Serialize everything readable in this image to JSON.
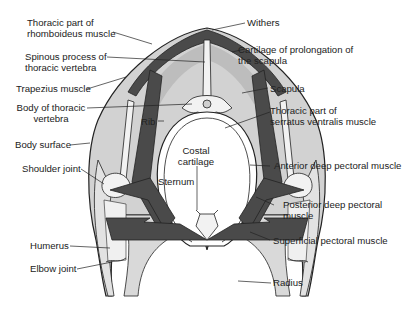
{
  "figure": {
    "type": "anatomical cross-section",
    "colors": {
      "background": "#ffffff",
      "body_fill": "#d2d2d2",
      "muscle_dark": "#4a4a4a",
      "bone_light": "#f2f2f2",
      "outline": "#222222"
    }
  },
  "labels": {
    "left": {
      "rhomboideus_1": "Thoracic part of",
      "rhomboideus_2": "rhomboideus muscle",
      "spinous_1": "Spinous process of",
      "spinous_2": "thoracic vertebra",
      "trapezius": "Trapezius muscle",
      "body_vert_1": "Body of thoracic",
      "body_vert_2": "vertebra",
      "body_surface": "Body surface",
      "shoulder_joint": "Shoulder joint",
      "humerus": "Humerus",
      "elbow_joint": "Elbow joint"
    },
    "right": {
      "withers": "Withers",
      "cartilage_1": "Cartilage of prolongation of",
      "cartilage_2": "the scapula",
      "scapula": "Scapula",
      "serratus_1": "Thoracic part of",
      "serratus_2": "serratus ventralis muscle",
      "anterior_deep": "Anterior deep pectoral muscle",
      "posterior_deep_1": "Posterior deep pectoral",
      "posterior_deep_2": "muscle",
      "superficial": "Superficial pectoral muscle",
      "radius": "Radius"
    },
    "center": {
      "rib": "Rib",
      "costal_1": "Costal",
      "costal_2": "cartilage",
      "sternum": "Sternum"
    }
  }
}
